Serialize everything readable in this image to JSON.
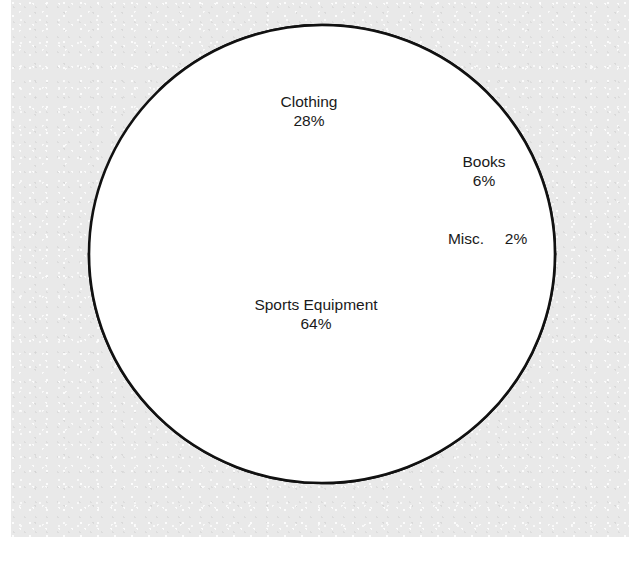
{
  "page": {
    "background_color": "#ffffff",
    "scan_color": "#e9e9e9",
    "ink_color": "#111111"
  },
  "bleed_through_text": [
    "the faint reverse side",
    "of the scanned page",
    "shows through here"
  ],
  "chart_data": {
    "type": "pie",
    "title": "",
    "subtitle": "",
    "xlabel": "",
    "ylabel": "",
    "grid": false,
    "legend_position": "none",
    "label_style": "inside-slice",
    "units": "percent",
    "total": 100,
    "center": {
      "x": 322,
      "y": 254
    },
    "radius_x": 233,
    "radius_y": 229,
    "stroke_color": "#111111",
    "stroke_width": 2.6,
    "fill_color": "#ffffff",
    "categories": [
      "Sports Equipment",
      "Clothing",
      "Books",
      "Misc."
    ],
    "values": [
      64,
      28,
      6,
      2
    ],
    "slices": [
      {
        "name": "Sports Equipment",
        "label": "Sports Equipment",
        "value_label": "64%",
        "value": 64,
        "start_angle_deg": 180,
        "end_angle_deg": 360,
        "label_x": 316,
        "label_y": 310,
        "value_x": 316,
        "value_y": 329,
        "text_anchor": "middle"
      },
      {
        "name": "Clothing",
        "label": "Clothing",
        "value_label": "28%",
        "value": 28,
        "start_angle_deg": 43,
        "end_angle_deg": 134,
        "label_x": 309,
        "label_y": 107,
        "value_x": 309,
        "value_y": 126,
        "text_anchor": "middle"
      },
      {
        "name": "Books",
        "label": "Books",
        "value_label": "6%",
        "value": 6,
        "start_angle_deg": 14.5,
        "end_angle_deg": 43,
        "label_x": 484,
        "label_y": 167,
        "value_x": 484,
        "value_y": 186,
        "text_anchor": "middle"
      },
      {
        "name": "Misc.",
        "label": "Misc.",
        "value_label": "2%",
        "value": 2,
        "start_angle_deg": 0,
        "end_angle_deg": 14.5,
        "label_x": 466,
        "label_y": 244,
        "value_x": 516,
        "value_y": 244,
        "text_anchor": "middle"
      }
    ]
  }
}
